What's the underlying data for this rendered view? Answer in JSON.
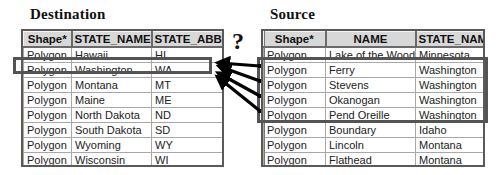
{
  "destination": {
    "title": "Destination",
    "columns": [
      "Shape*",
      "STATE_NAME",
      "STATE_ABBR"
    ],
    "rows": [
      [
        "Polygon",
        "Hawaii",
        "HI"
      ],
      [
        "Polygon",
        "Washington",
        "WA"
      ],
      [
        "Polygon",
        "Montana",
        "MT"
      ],
      [
        "Polygon",
        "Maine",
        "ME"
      ],
      [
        "Polygon",
        "North Dakota",
        "ND"
      ],
      [
        "Polygon",
        "South Dakota",
        "SD"
      ],
      [
        "Polygon",
        "Wyoming",
        "WY"
      ],
      [
        "Polygon",
        "Wisconsin",
        "WI"
      ]
    ],
    "highlighted_row": 1
  },
  "source": {
    "title": "Source",
    "columns": [
      "Shape*",
      "NAME",
      "STATE_NAM"
    ],
    "rows": [
      [
        "Polygon",
        "Lake of the Woods",
        "Minnesota"
      ],
      [
        "Polygon",
        "Ferry",
        "Washington"
      ],
      [
        "Polygon",
        "Stevens",
        "Washington"
      ],
      [
        "Polygon",
        "Okanogan",
        "Washington"
      ],
      [
        "Polygon",
        "Pend Oreille",
        "Washington"
      ],
      [
        "Polygon",
        "Boundary",
        "Idaho"
      ],
      [
        "Polygon",
        "Lincoln",
        "Montana"
      ],
      [
        "Polygon",
        "Flathead",
        "Montana"
      ]
    ],
    "highlighted_rows": [
      1,
      2,
      3,
      4
    ]
  },
  "annotation": {
    "question_mark": "?",
    "arrow_count": 4,
    "arrow_direction": "source-to-destination"
  },
  "colors": {
    "header_bg": "#d8d8d8",
    "highlight_border": "#545454",
    "arrow": "#000000"
  }
}
